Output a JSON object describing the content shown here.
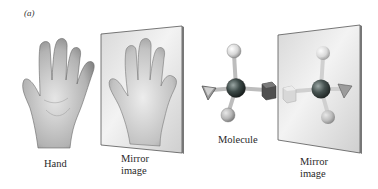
{
  "figure": {
    "panel_label": "(a)",
    "labels": {
      "hand": "Hand",
      "hand_mirror_line1": "Mirror",
      "hand_mirror_line2": "image",
      "molecule": "Molecule",
      "molecule_mirror_line1": "Mirror",
      "molecule_mirror_line2": "image"
    },
    "icons": {
      "hand": "hand-illustration",
      "hand_mirror": "mirror-plane-with-reflected-hand",
      "molecule": "tetrahedral-molecule-ball-and-stick",
      "molecule_mirror": "mirror-plane-with-reflected-molecule"
    },
    "colors": {
      "background": "#ffffff",
      "mirror_fill": "#e4e4e4",
      "mirror_edge": "#555555",
      "skin": "#b9b9b9",
      "central_atom": "#3c4a48",
      "light_atom": "#dcdcdc",
      "cube": "#5a5a5a",
      "triangle": "#8a8a8a"
    }
  }
}
